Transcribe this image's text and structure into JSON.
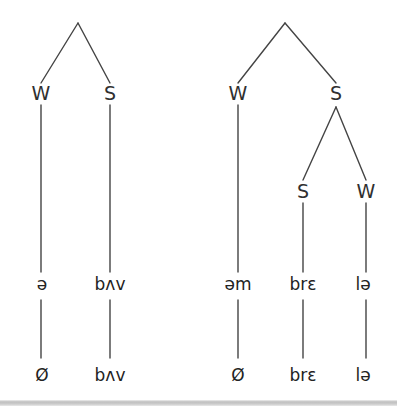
{
  "figure": {
    "type": "metrical-tree-diagram",
    "background_color": "#ffffff",
    "line_color": "#444444",
    "text_color": "#2b2b2b",
    "trees": [
      {
        "id": "left-tree",
        "root": {
          "x": 78,
          "y": 23,
          "children": [
            {
              "label": "W",
              "x": 41,
              "y": 93,
              "tier2": "ə",
              "tier3": "Ø"
            },
            {
              "label": "S",
              "x": 110,
              "y": 93,
              "tier2": "bʌv",
              "tier3": "bʌv"
            }
          ]
        }
      },
      {
        "id": "right-tree",
        "root": {
          "x": 285,
          "y": 23,
          "children": [
            {
              "label": "W",
              "x": 238,
              "y": 93,
              "tier2": "əm",
              "tier3": "Ø"
            },
            {
              "label": "S",
              "x": 336,
              "y": 93,
              "children": [
                {
                  "label": "S",
                  "x": 303,
                  "y": 190,
                  "tier2": "brɛ",
                  "tier3": "brɛ"
                },
                {
                  "label": "W",
                  "x": 366,
                  "y": 190,
                  "tier2": "lə",
                  "tier3": "lə"
                }
              ]
            }
          ]
        }
      }
    ],
    "nodes": {
      "left_w": "W",
      "left_s": "S",
      "right_w": "W",
      "right_s": "S",
      "right_sub_s": "S",
      "right_sub_w": "W"
    },
    "tier2": {
      "left_w": "ə",
      "left_s": "bʌv",
      "right_w": "əm",
      "right_sub_s": "brɛ",
      "right_sub_w": "lə"
    },
    "tier3": {
      "left_w": "Ø",
      "left_s": "bʌv",
      "right_w": "Ø",
      "right_sub_s": "brɛ",
      "right_sub_w": "lə"
    }
  }
}
